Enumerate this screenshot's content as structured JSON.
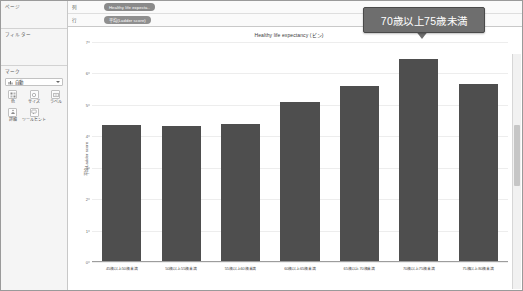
{
  "sidebar": {
    "pages": {
      "title": "ページ"
    },
    "filters": {
      "title": "フィルター"
    },
    "marks": {
      "title": "マーク",
      "type_label": "自動",
      "buttons": [
        {
          "label": "色",
          "icon": "color-icon"
        },
        {
          "label": "サイズ",
          "icon": "size-icon"
        },
        {
          "label": "ラベル",
          "icon": "label-icon"
        },
        {
          "label": "詳細",
          "icon": "detail-icon"
        },
        {
          "label": "ツールヒント",
          "icon": "tooltip-icon"
        }
      ]
    }
  },
  "shelves": {
    "columns_label": "列",
    "columns_pill": "Healthy life expecta..",
    "rows_label": "行",
    "rows_pill": "平均(Ladder score)"
  },
  "callout": {
    "text": "70歳以上75歳未満"
  },
  "chart_data": {
    "type": "bar",
    "title": "Healthy life expectancy (ビン)",
    "xlabel": "",
    "ylabel": "平均 Ladder score",
    "ylim": [
      0,
      7
    ],
    "yticks": [
      0,
      1,
      2,
      3,
      4,
      5,
      6,
      7
    ],
    "grid": true,
    "legend": "none",
    "bar_color": "#4e4e4e",
    "categories": [
      "45歳以上50歳未満",
      "50歳以上55歳未満",
      "55歳以上60歳未満",
      "60歳以上65歳未満",
      "65歳以上70歳未満",
      "70歳以上75歳未満",
      "75歳以上80歳未満"
    ],
    "values": [
      4.35,
      4.33,
      4.4,
      5.1,
      5.6,
      6.45,
      5.65
    ],
    "highlighted_category": "70歳以上75歳未満"
  }
}
